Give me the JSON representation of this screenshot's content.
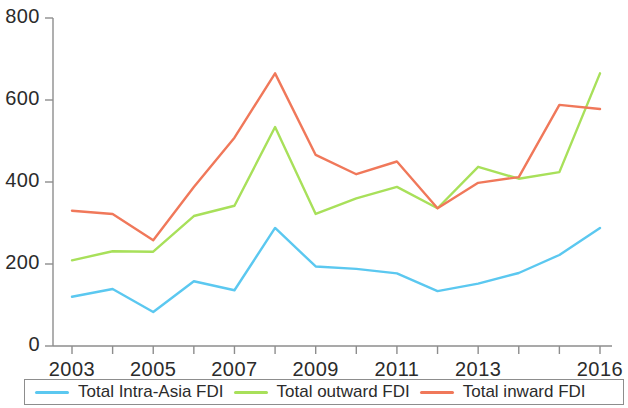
{
  "chart_data": {
    "type": "line",
    "title": "",
    "xlabel": "",
    "ylabel": "",
    "xlim": [
      2003,
      2016
    ],
    "ylim": [
      0,
      800
    ],
    "grid": false,
    "legend_position": "bottom",
    "x": [
      2003,
      2004,
      2005,
      2006,
      2007,
      2008,
      2009,
      2010,
      2011,
      2012,
      2013,
      2014,
      2015,
      2016
    ],
    "xtick_labels": [
      "2003",
      "2005",
      "2007",
      "2009",
      "2011",
      "2013",
      "2016"
    ],
    "xtick_values": [
      2003,
      2005,
      2007,
      2009,
      2011,
      2013,
      2016
    ],
    "ytick_labels": [
      "0",
      "200",
      "400",
      "600",
      "800"
    ],
    "ytick_values": [
      0,
      200,
      400,
      600,
      800
    ],
    "series": [
      {
        "name": "Total Intra-Asia FDI",
        "color": "#5bc8f0",
        "values": [
          120,
          139,
          83,
          158,
          136,
          288,
          194,
          188,
          177,
          134,
          152,
          178,
          222,
          288
        ]
      },
      {
        "name": "Total outward FDI",
        "color": "#a8e05a",
        "values": [
          209,
          231,
          230,
          317,
          342,
          534,
          322,
          360,
          388,
          336,
          437,
          408,
          424,
          665
        ]
      },
      {
        "name": "Total inward FDI",
        "color": "#f0785a",
        "values": [
          330,
          322,
          258,
          388,
          508,
          665,
          466,
          419,
          450,
          336,
          398,
          412,
          588,
          578
        ]
      }
    ]
  },
  "legend": {
    "items": [
      {
        "label": "Total Intra-Asia FDI",
        "color": "#5bc8f0"
      },
      {
        "label": "Total outward FDI",
        "color": "#a8e05a"
      },
      {
        "label": "Total inward FDI",
        "color": "#f0785a"
      }
    ]
  },
  "axis": {
    "colors": {
      "line": "#8d8d8d",
      "text": "#2b2b2b"
    }
  }
}
